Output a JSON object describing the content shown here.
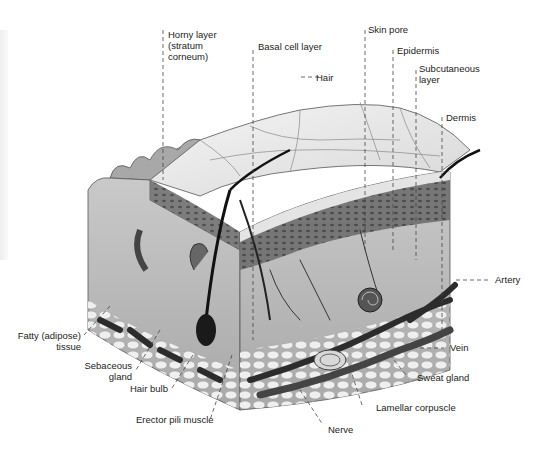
{
  "colors": {
    "background": "#ffffff",
    "label_text": "#222222",
    "leader_line": "#444444"
  },
  "labels": {
    "horny_layer": {
      "line1": "Horny layer",
      "line2": "(stratum",
      "line3": "corneum)"
    },
    "basal_cell_layer": "Basal cell layer",
    "hair": "Hair",
    "skin_pore": "Skin pore",
    "epidermis": "Epidermis",
    "subcutaneous_layer": {
      "line1": "Subcutaneous",
      "line2": "layer"
    },
    "dermis": "Dermis",
    "artery": "Artery",
    "vein": "Vein",
    "sweat_gland": "Sweat gland",
    "lamellar_corpuscle": "Lamellar corpuscle",
    "nerve": "Nerve",
    "erector_pili_muscle": "Erector pili muscle",
    "hair_bulb": "Hair bulb",
    "sebaceous_gland": {
      "line1": "Sebaceous",
      "line2": "gland"
    },
    "fatty_tissue": {
      "line1": "Fatty (adipose)",
      "line2": "tissue"
    }
  }
}
